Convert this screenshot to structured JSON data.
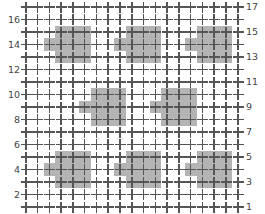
{
  "chart_data": {
    "type": "scatter",
    "title": "",
    "subtitle": "",
    "xlabel": "",
    "ylabel": "",
    "grid": true,
    "legend": null,
    "marker": "plus",
    "marker_color": "#555555",
    "highlight_color": "#b4b4b4",
    "background_color": "#ffffff",
    "columns": 19,
    "rows": 17,
    "xlim": [
      1,
      19
    ],
    "ylim": [
      1,
      17
    ],
    "left_axis": {
      "position": "left",
      "tick_labels": [
        "16",
        "14",
        "12",
        "10",
        "8",
        "6",
        "4",
        "2"
      ],
      "tick_values": [
        16,
        14,
        12,
        10,
        8,
        6,
        4,
        2
      ]
    },
    "right_axis": {
      "position": "right",
      "tick_labels": [
        "17",
        "15",
        "13",
        "11",
        "9",
        "7",
        "5",
        "3",
        "1"
      ],
      "tick_values": [
        17,
        15,
        13,
        11,
        9,
        7,
        5,
        3,
        1
      ]
    },
    "highlight_shape": {
      "description": "3x3 block with one extra cell protruding on the left at mid-height",
      "offsets": [
        [
          0,
          0
        ],
        [
          1,
          0
        ],
        [
          2,
          0
        ],
        [
          0,
          1
        ],
        [
          1,
          1
        ],
        [
          2,
          1
        ],
        [
          0,
          2
        ],
        [
          1,
          2
        ],
        [
          2,
          2
        ],
        [
          -1,
          1
        ]
      ]
    },
    "highlight_origins": [
      {
        "col": 4,
        "row": 13
      },
      {
        "col": 10,
        "row": 13
      },
      {
        "col": 16,
        "row": 13
      },
      {
        "col": 7,
        "row": 8
      },
      {
        "col": 13,
        "row": 8
      },
      {
        "col": 4,
        "row": 3
      },
      {
        "col": 10,
        "row": 3
      },
      {
        "col": 16,
        "row": 3
      }
    ]
  }
}
